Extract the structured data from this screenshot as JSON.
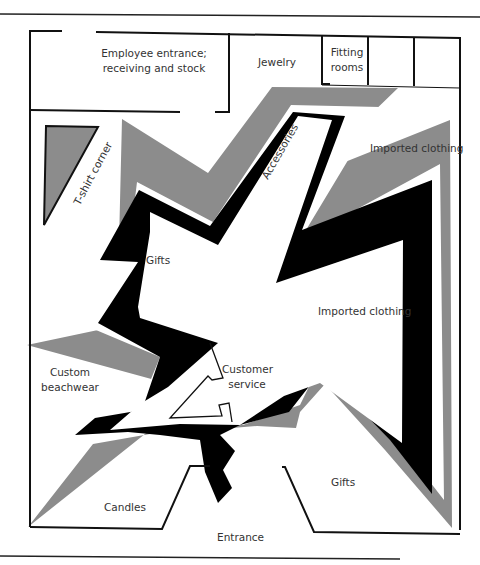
{
  "figure": {
    "type": "store-floor-plan",
    "colors": {
      "wall": "#111111",
      "gray_band": "#8c8c8c",
      "black_band": "#000000",
      "background": "#ffffff",
      "text": "#333333"
    }
  },
  "areas": {
    "employee": {
      "line1": "Employee entrance;",
      "line2": "receiving and stock"
    },
    "jewelry": "Jewelry",
    "fitting": {
      "line1": "Fitting",
      "line2": "rooms"
    },
    "tshirt": "T-shirt corner",
    "accessories": "Accessories",
    "imported_top": "Imported clothing",
    "gifts_center": "Gifts",
    "imported_mid": "Imported clothing",
    "customer_service": {
      "line1": "Customer",
      "line2": "service"
    },
    "beachwear": {
      "line1": "Custom",
      "line2": "beachwear"
    },
    "candles": "Candles",
    "gifts_bottom": "Gifts",
    "entrance": "Entrance"
  }
}
